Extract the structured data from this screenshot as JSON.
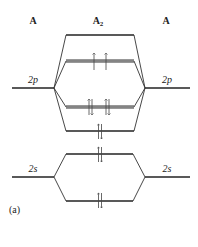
{
  "diagram": {
    "columns": {
      "left": "A",
      "center_base": "A",
      "center_sub": "2",
      "right": "A"
    },
    "atomic_levels": {
      "left_2p": "2p",
      "right_2p": "2p",
      "left_2s": "2s",
      "right_2s": "2s"
    },
    "molecular_orbitals": [
      {
        "name": "sigma*2p",
        "electrons": 0
      },
      {
        "name": "pi*2p",
        "electrons": 2,
        "spins": "up,up",
        "degenerate": true
      },
      {
        "name": "pi2p",
        "electrons": 4,
        "spins": "updown,updown",
        "degenerate": true
      },
      {
        "name": "sigma2p",
        "electrons": 2,
        "spins": "updown"
      },
      {
        "name": "sigma*2s",
        "electrons": 2,
        "spins": "updown"
      },
      {
        "name": "sigma2s",
        "electrons": 2,
        "spins": "updown"
      }
    ],
    "panel_label": "(a)",
    "colors": {
      "line": "#222222",
      "background": "#ffffff"
    }
  }
}
